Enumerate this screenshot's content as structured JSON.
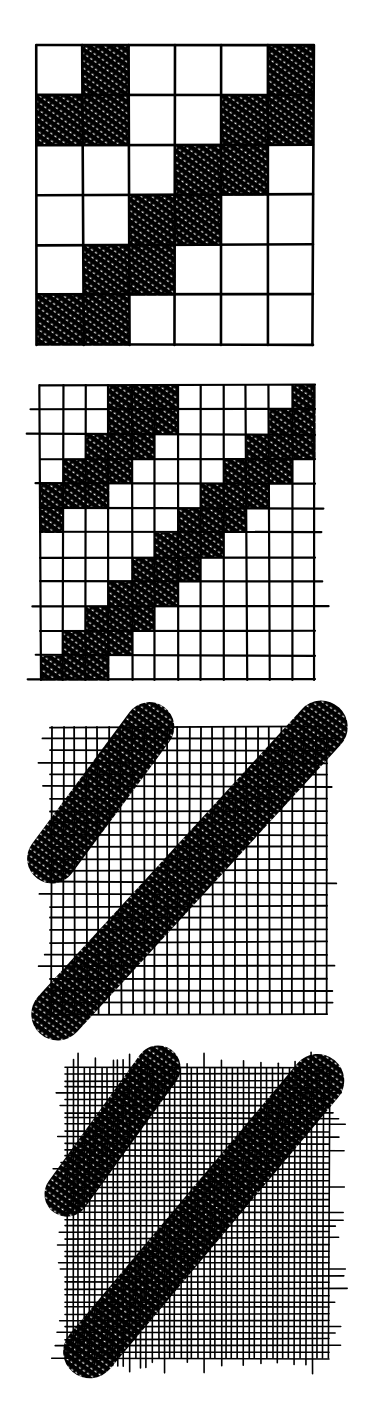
{
  "figure": {
    "ink_color": "#000000",
    "paper_color": "#ffffff",
    "panels": [
      {
        "id": "grid-6",
        "x": 37,
        "y": 45,
        "w": 276,
        "h": 300,
        "cells": 6,
        "stroke": 2.6,
        "filled": [
          [
            0,
            1
          ],
          [
            0,
            5
          ],
          [
            1,
            0
          ],
          [
            1,
            1
          ],
          [
            1,
            4
          ],
          [
            1,
            5
          ],
          [
            2,
            3
          ],
          [
            2,
            4
          ],
          [
            3,
            2
          ],
          [
            3,
            3
          ],
          [
            4,
            1
          ],
          [
            4,
            2
          ],
          [
            5,
            0
          ],
          [
            5,
            1
          ]
        ]
      },
      {
        "id": "grid-12",
        "x": 40,
        "y": 385,
        "w": 275,
        "h": 295,
        "cells": 12,
        "stroke": 2.2,
        "filled": [
          [
            0,
            3
          ],
          [
            0,
            4
          ],
          [
            0,
            5
          ],
          [
            0,
            11
          ],
          [
            1,
            3
          ],
          [
            1,
            4
          ],
          [
            1,
            5
          ],
          [
            1,
            10
          ],
          [
            1,
            11
          ],
          [
            2,
            2
          ],
          [
            2,
            3
          ],
          [
            2,
            4
          ],
          [
            2,
            9
          ],
          [
            2,
            10
          ],
          [
            2,
            11
          ],
          [
            3,
            1
          ],
          [
            3,
            2
          ],
          [
            3,
            3
          ],
          [
            3,
            8
          ],
          [
            3,
            9
          ],
          [
            3,
            10
          ],
          [
            4,
            0
          ],
          [
            4,
            1
          ],
          [
            4,
            2
          ],
          [
            4,
            7
          ],
          [
            4,
            8
          ],
          [
            4,
            9
          ],
          [
            5,
            0
          ],
          [
            5,
            6
          ],
          [
            5,
            7
          ],
          [
            5,
            8
          ],
          [
            6,
            5
          ],
          [
            6,
            6
          ],
          [
            6,
            7
          ],
          [
            7,
            4
          ],
          [
            7,
            5
          ],
          [
            7,
            6
          ],
          [
            8,
            3
          ],
          [
            8,
            4
          ],
          [
            8,
            5
          ],
          [
            9,
            2
          ],
          [
            9,
            3
          ],
          [
            9,
            4
          ],
          [
            10,
            1
          ],
          [
            10,
            2
          ],
          [
            10,
            3
          ],
          [
            11,
            0
          ],
          [
            11,
            1
          ],
          [
            11,
            2
          ]
        ]
      },
      {
        "id": "grid-24",
        "x": 52,
        "y": 727,
        "w": 275,
        "h": 287,
        "cells": 24,
        "stroke": 1.8,
        "bands": [
          {
            "r0": 0,
            "c0": 8.5,
            "r1": 11,
            "c1": 0,
            "width": 3.2
          },
          {
            "r0": 0,
            "c0": 23.5,
            "r1": 24,
            "c1": 0.5,
            "width": 3.4
          }
        ]
      },
      {
        "id": "grid-48",
        "x": 67,
        "y": 1068,
        "w": 262,
        "h": 290,
        "cells": 46,
        "stroke": 1.6,
        "bands": [
          {
            "r0": 0,
            "c0": 16,
            "r1": 20,
            "c1": 0,
            "width": 5.5
          },
          {
            "r0": 2,
            "c0": 44,
            "r1": 45,
            "c1": 4,
            "width": 6.5
          }
        ]
      }
    ]
  }
}
